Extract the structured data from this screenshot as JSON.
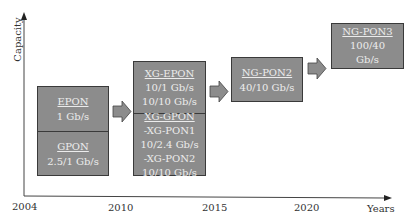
{
  "axes": {
    "y_label": "Capacity",
    "x_label": "Years",
    "x_ticks": [
      "2004",
      "2010",
      "2015",
      "2020"
    ]
  },
  "stages": [
    {
      "sections": [
        {
          "title": "EPON",
          "lines": [
            "1 Gb/s"
          ]
        },
        {
          "title": "GPON",
          "lines": [
            "2.5/1 Gb/s"
          ]
        }
      ]
    },
    {
      "sections": [
        {
          "title": "XG-EPON",
          "lines": [
            "10/1 Gb/s",
            "10/10 Gb/s"
          ]
        },
        {
          "title": "XG-GPON",
          "lines": [
            "-XG-PON1",
            "10/2.4 Gb/s",
            "-XG-PON2",
            "10/10 Gb/s"
          ]
        }
      ]
    },
    {
      "sections": [
        {
          "title": "NG-PON2",
          "lines": [
            "40/10 Gb/s"
          ]
        }
      ]
    },
    {
      "sections": [
        {
          "title": "NG-PON3",
          "lines": [
            "100/40",
            "Gb/s"
          ]
        }
      ]
    }
  ],
  "colors": {
    "box_fill": "#8c8c8c",
    "box_border": "#3a3a3a",
    "box_text": "#ececec",
    "arrow_fill": "#8c8c8c",
    "axis": "#444444"
  }
}
